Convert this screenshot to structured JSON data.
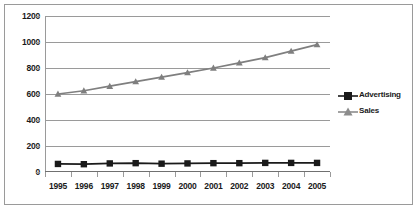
{
  "chart_data": {
    "type": "line",
    "title": "",
    "xlabel": "",
    "ylabel": "",
    "categories": [
      "1995",
      "1996",
      "1997",
      "1998",
      "1999",
      "2000",
      "2001",
      "2002",
      "2003",
      "2004",
      "2005"
    ],
    "ylim": [
      0,
      1200
    ],
    "yticks": [
      0,
      200,
      400,
      600,
      800,
      1000,
      1200
    ],
    "ytick_labels": [
      "0",
      "200",
      "400",
      "600",
      "800",
      "1000",
      "1200"
    ],
    "grid": true,
    "legend_position": "right",
    "series": [
      {
        "name": "Advertising",
        "color": "#1a1a1a",
        "marker": "square",
        "values": [
          62,
          60,
          66,
          68,
          64,
          66,
          68,
          68,
          70,
          70,
          70
        ]
      },
      {
        "name": "Sales",
        "color": "#7f7f7f",
        "marker": "triangle",
        "values": [
          600,
          625,
          660,
          695,
          730,
          765,
          800,
          840,
          880,
          930,
          980
        ]
      }
    ]
  },
  "legend": {
    "items": [
      {
        "label": "Advertising"
      },
      {
        "label": "Sales"
      }
    ]
  }
}
